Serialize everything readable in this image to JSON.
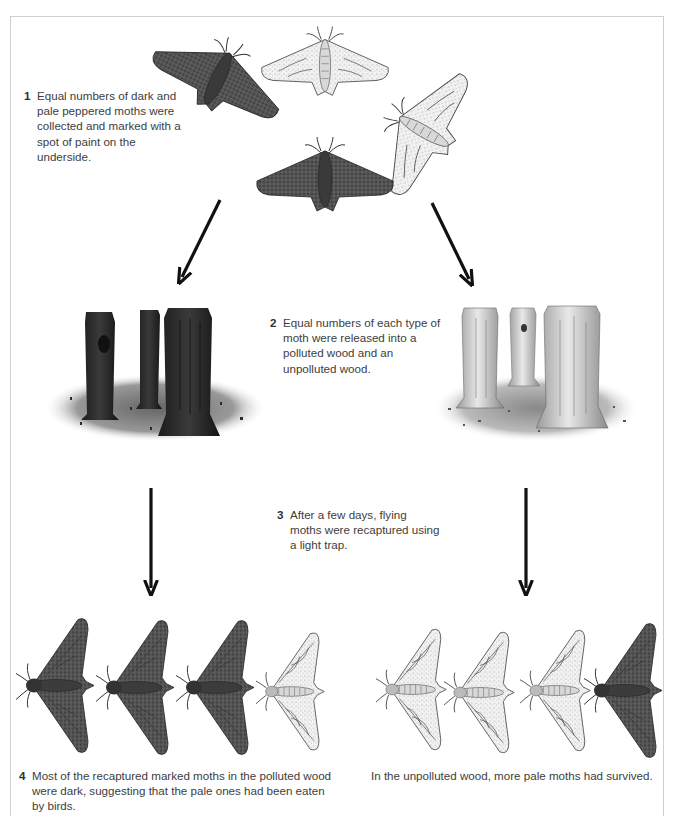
{
  "diagram": {
    "steps": [
      {
        "number": "1",
        "text": "Equal numbers of dark and pale peppered moths were collected and marked with a spot of paint on the underside."
      },
      {
        "number": "2",
        "text": "Equal numbers of each type of moth were released into a polluted wood and an unpolluted wood."
      },
      {
        "number": "3",
        "text": "After a few days, flying moths were recaptured using a light trap."
      },
      {
        "number": "4",
        "text": "Most of the recaptured marked moths in the polluted wood were dark, suggesting that the pale ones had been eaten by birds."
      }
    ],
    "result_unpolluted": "In the unpolluted wood, more pale moths had survived.",
    "initial_moths": [
      "dark",
      "pale",
      "pale",
      "dark"
    ],
    "woods": [
      {
        "name": "polluted wood",
        "trunk_tone": "dark"
      },
      {
        "name": "unpolluted wood",
        "trunk_tone": "pale"
      }
    ],
    "recaptured": {
      "polluted": [
        "dark",
        "dark",
        "dark",
        "pale"
      ],
      "unpolluted": [
        "pale",
        "pale",
        "pale",
        "dark"
      ]
    },
    "colors": {
      "dark_moth": "#4a4a4a",
      "pale_moth": "#e6e6e6",
      "arrow": "#111111",
      "frame": "#cfcfcf"
    }
  }
}
